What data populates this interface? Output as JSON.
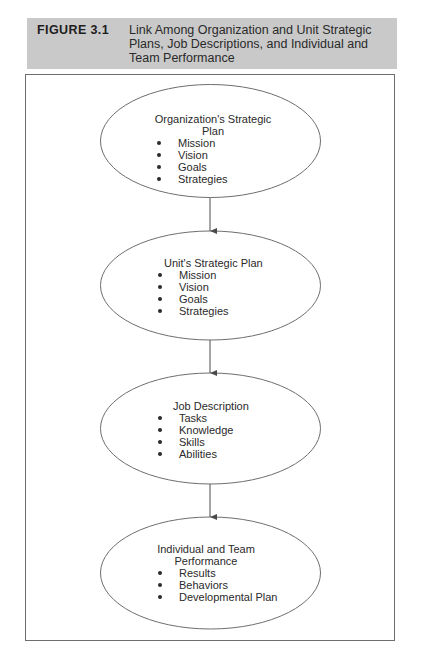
{
  "figure": {
    "label": "FIGURE 3.1",
    "title": "Link Among Organization and Unit Strategic Plans, Job Descriptions, and Individual and Team Performance"
  },
  "nodes": [
    {
      "title": "Organization's Strategic Plan",
      "items": [
        "Mission",
        "Vision",
        "Goals",
        "Strategies"
      ]
    },
    {
      "title": "Unit's Strategic Plan",
      "items": [
        "Mission",
        "Vision",
        "Goals",
        "Strategies"
      ]
    },
    {
      "title": "Job Description",
      "items": [
        "Tasks",
        "Knowledge",
        "Skills",
        "Abilities"
      ]
    },
    {
      "title": "Individual and Team Performance",
      "items": [
        "Results",
        "Behaviors",
        "Developmental Plan"
      ]
    }
  ],
  "edges": [
    {
      "from": 0,
      "to": 1
    },
    {
      "from": 1,
      "to": 2
    },
    {
      "from": 2,
      "to": 3
    }
  ],
  "colors": {
    "header_bg": "#c9c9c9",
    "stroke": "#6e6e6e",
    "text": "#2a2a2a"
  }
}
